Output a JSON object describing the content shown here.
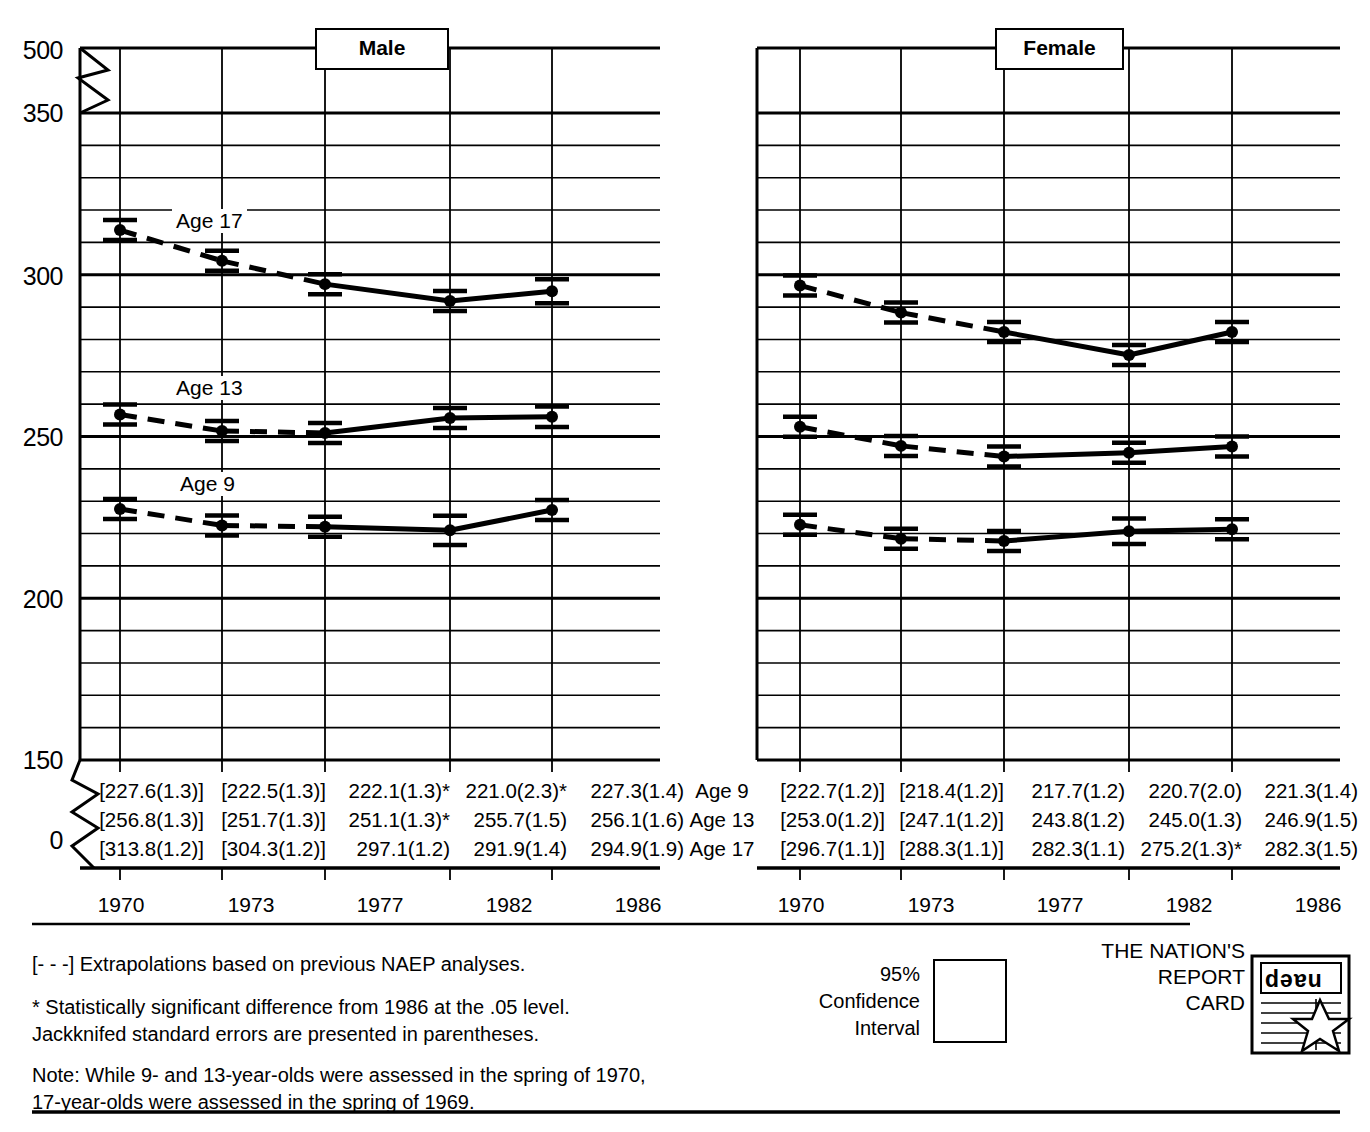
{
  "panels": {
    "male": {
      "title": "Male"
    },
    "female": {
      "title": "Female"
    }
  },
  "axis": {
    "y_ticks": [
      "500",
      "350",
      "300",
      "250",
      "200",
      "150",
      "0"
    ],
    "x_ticks": [
      "1970",
      "1973",
      "1977",
      "1982",
      "1986"
    ]
  },
  "series_labels": {
    "age17": "Age 17",
    "age13": "Age 13",
    "age9": "Age 9"
  },
  "row_labels": [
    "Age 9",
    "Age 13",
    "Age 17"
  ],
  "table": {
    "male": {
      "age9": [
        "[227.6(1.3)]",
        "[222.5(1.3)]",
        "222.1(1.3)*",
        "221.0(2.3)*",
        "227.3(1.4)"
      ],
      "age13": [
        "[256.8(1.3)]",
        "[251.7(1.3)]",
        "251.1(1.3)*",
        "255.7(1.5)",
        "256.1(1.6)"
      ],
      "age17": [
        "[313.8(1.2)]",
        "[304.3(1.2)]",
        "297.1(1.2)",
        "291.9(1.4)",
        "294.9(1.9)"
      ]
    },
    "female": {
      "age9": [
        "[222.7(1.2)]",
        "[218.4(1.2)]",
        "217.7(1.2)",
        "220.7(2.0)",
        "221.3(1.4)"
      ],
      "age13": [
        "[253.0(1.2)]",
        "[247.1(1.2)]",
        "243.8(1.2)",
        "245.0(1.3)",
        "246.9(1.5)"
      ],
      "age17": [
        "[296.7(1.1)]",
        "[288.3(1.1)]",
        "282.3(1.1)",
        "275.2(1.3)*",
        "282.3(1.5)"
      ]
    }
  },
  "notes": {
    "extrapolation": "[- - -] Extrapolations based on previous NAEP analyses.",
    "significance_line1": "* Statistically significant difference from 1986 at the .05 level.",
    "significance_line2": "Jackknifed standard errors are presented in parentheses.",
    "note_line1": "Note: While 9- and 13-year-olds were assessed in the spring of 1970,",
    "note_line2": "17-year-olds were assessed in the spring of 1969."
  },
  "legend": {
    "line1": "95%",
    "line2": "Confidence",
    "line3": "Interval"
  },
  "brand": {
    "line1": "THE NATION'S",
    "line2": "REPORT",
    "line3": "CARD",
    "logo_word": "naep"
  },
  "chart_data": {
    "type": "line",
    "xlabel": "",
    "ylabel": "",
    "x": [
      1970,
      1973,
      1977,
      1982,
      1986
    ],
    "ylim": [
      150,
      350
    ],
    "grid": true,
    "legend_position": "inline-labels",
    "panels": [
      {
        "name": "Male",
        "series": [
          {
            "name": "Age 17",
            "values": [
              313.8,
              304.3,
              297.1,
              291.9,
              294.9
            ],
            "errors": [
              1.2,
              1.2,
              1.2,
              1.4,
              1.9
            ],
            "extrapolated_segments": [
              [
                1970,
                1973
              ],
              [
                1973,
                1977
              ]
            ],
            "significant": [
              false,
              false,
              false,
              false,
              false
            ]
          },
          {
            "name": "Age 13",
            "values": [
              256.8,
              251.7,
              251.1,
              255.7,
              256.1
            ],
            "errors": [
              1.3,
              1.3,
              1.3,
              1.5,
              1.6
            ],
            "extrapolated_segments": [
              [
                1970,
                1973
              ],
              [
                1973,
                1977
              ]
            ],
            "significant": [
              false,
              false,
              true,
              false,
              false
            ]
          },
          {
            "name": "Age 9",
            "values": [
              227.6,
              222.5,
              222.1,
              221.0,
              227.3
            ],
            "errors": [
              1.3,
              1.3,
              1.3,
              2.3,
              1.4
            ],
            "extrapolated_segments": [
              [
                1970,
                1973
              ],
              [
                1973,
                1977
              ]
            ],
            "significant": [
              false,
              false,
              true,
              true,
              false
            ]
          }
        ]
      },
      {
        "name": "Female",
        "series": [
          {
            "name": "Age 17",
            "values": [
              296.7,
              288.3,
              282.3,
              275.2,
              282.3
            ],
            "errors": [
              1.1,
              1.1,
              1.1,
              1.3,
              1.5
            ],
            "extrapolated_segments": [
              [
                1970,
                1973
              ],
              [
                1973,
                1977
              ]
            ],
            "significant": [
              false,
              false,
              false,
              true,
              false
            ]
          },
          {
            "name": "Age 13",
            "values": [
              253.0,
              247.1,
              243.8,
              245.0,
              246.9
            ],
            "errors": [
              1.2,
              1.2,
              1.2,
              1.3,
              1.5
            ],
            "extrapolated_segments": [
              [
                1970,
                1973
              ],
              [
                1973,
                1977
              ]
            ],
            "significant": [
              false,
              false,
              false,
              false,
              false
            ]
          },
          {
            "name": "Age 9",
            "values": [
              222.7,
              218.4,
              217.7,
              220.7,
              221.3
            ],
            "errors": [
              1.2,
              1.2,
              1.2,
              2.0,
              1.4
            ],
            "extrapolated_segments": [
              [
                1970,
                1973
              ],
              [
                1973,
                1977
              ]
            ],
            "significant": [
              false,
              false,
              false,
              false,
              false
            ]
          }
        ]
      }
    ]
  }
}
